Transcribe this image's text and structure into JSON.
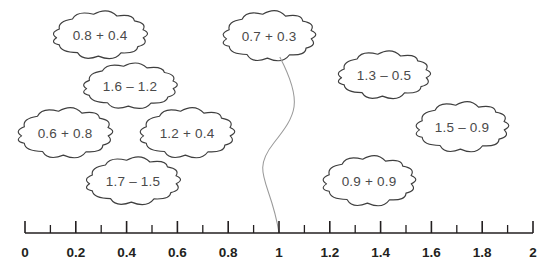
{
  "figure": {
    "type": "number-line-activity",
    "background_color": "#ffffff",
    "outline_color": "#3f3f3f",
    "cloud_text_color": "#4a4a4a",
    "axis_color": "#231f20",
    "connector_color": "#9a9a9a"
  },
  "clouds": [
    {
      "id": "cloud-08-plus-04",
      "expression": "0.8 + 0.4",
      "cx": 100,
      "cy": 35,
      "w": 92,
      "h": 42,
      "connected": false
    },
    {
      "id": "cloud-16-minus-12",
      "expression": "1.6 – 1.2",
      "cx": 130,
      "cy": 86,
      "w": 92,
      "h": 40,
      "connected": false
    },
    {
      "id": "cloud-06-plus-08",
      "expression": "0.6 + 0.8",
      "cx": 65,
      "cy": 133,
      "w": 92,
      "h": 44,
      "connected": false
    },
    {
      "id": "cloud-12-plus-04",
      "expression": "1.2 + 0.4",
      "cx": 187,
      "cy": 133,
      "w": 92,
      "h": 44,
      "connected": false
    },
    {
      "id": "cloud-17-minus-15",
      "expression": "1.7 – 1.5",
      "cx": 133,
      "cy": 181,
      "w": 92,
      "h": 42,
      "connected": false
    },
    {
      "id": "cloud-07-plus-03",
      "expression": "0.7 + 0.3",
      "cx": 269,
      "cy": 36,
      "w": 90,
      "h": 44,
      "connected": true
    },
    {
      "id": "cloud-13-minus-05",
      "expression": "1.3 – 0.5",
      "cx": 384,
      "cy": 75,
      "w": 90,
      "h": 42,
      "connected": false
    },
    {
      "id": "cloud-15-minus-09",
      "expression": "1.5 – 0.9",
      "cx": 462,
      "cy": 127,
      "w": 90,
      "h": 44,
      "connected": false
    },
    {
      "id": "cloud-09-plus-09",
      "expression": "0.9 + 0.9",
      "cx": 369,
      "cy": 181,
      "w": 90,
      "h": 44,
      "connected": false
    }
  ],
  "connector": {
    "name": "curve-from-07-plus-03-to-1",
    "from_cloud": "cloud-07-plus-03",
    "to_tick_value": "1"
  },
  "number_line": {
    "min": 0,
    "max": 2,
    "minor_step": 0.1,
    "major_step": 0.2,
    "axis_y": 233,
    "x_start": 25,
    "x_end": 533,
    "major_labels": [
      {
        "value": 0,
        "text": "0"
      },
      {
        "value": 0.2,
        "text": "0.2"
      },
      {
        "value": 0.4,
        "text": "0.4"
      },
      {
        "value": 0.6,
        "text": "0.6"
      },
      {
        "value": 0.8,
        "text": "0.8"
      },
      {
        "value": 1,
        "text": "1"
      },
      {
        "value": 1.2,
        "text": "1.2"
      },
      {
        "value": 1.4,
        "text": "1.4"
      },
      {
        "value": 1.6,
        "text": "1.6"
      },
      {
        "value": 1.8,
        "text": "1.8"
      },
      {
        "value": 2,
        "text": "2"
      }
    ],
    "minor_ticks": [
      0.1,
      0.3,
      0.5,
      0.7,
      0.9,
      1.1,
      1.3,
      1.5,
      1.7,
      1.9
    ]
  }
}
